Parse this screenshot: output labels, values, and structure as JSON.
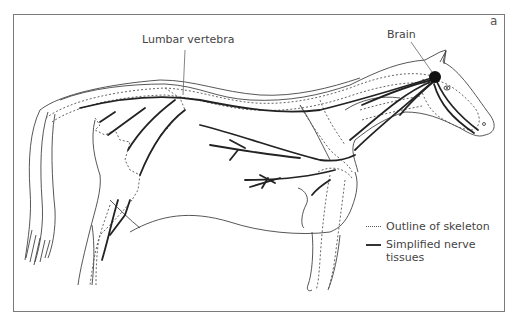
{
  "figure": {
    "panel_letter": "a",
    "labels": {
      "lumbar_vertebra": "Lumbar vertebra",
      "brain": "Brain"
    },
    "legend": [
      {
        "style": "dotted",
        "text": "Outline of skeleton"
      },
      {
        "style": "solid",
        "text": "Simplified nerve tissues",
        "line1": "Simplified nerve",
        "line2": "tissues"
      }
    ],
    "colors": {
      "frame": "#7a7a7a",
      "outline": "#444444",
      "nerve": "#222222",
      "skeleton": "#555555",
      "brain": "#111111"
    }
  }
}
